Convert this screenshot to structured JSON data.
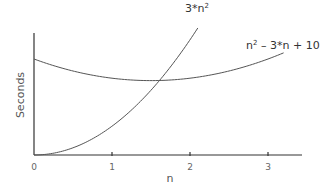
{
  "chart_data": {
    "type": "line",
    "title": "",
    "xlabel": "n",
    "ylabel": "Seconds",
    "xlim": [
      0,
      3.45
    ],
    "ylim": [
      0,
      15
    ],
    "x_ticks": [
      0,
      1,
      2,
      3
    ],
    "x_tick_labels": [
      "0",
      "1",
      "2",
      "3"
    ],
    "y_ticks": [],
    "grid": false,
    "legend": "inline labels at curve ends",
    "series": [
      {
        "name": "3*n²",
        "label_main": "3*n",
        "label_sup": "2",
        "formula": "3*n^2",
        "x": [
          0,
          0.25,
          0.5,
          0.75,
          1.0,
          1.25,
          1.5,
          1.75,
          2.0,
          2.1
        ],
        "values": [
          0,
          0.19,
          0.75,
          1.69,
          3.0,
          4.69,
          6.75,
          9.19,
          12.0,
          13.23
        ]
      },
      {
        "name": "n² – 3*n + 10",
        "label_main": "n",
        "label_sup": "2",
        "label_rest": " – 3*n + 10",
        "formula": "n^2 - 3*n + 10",
        "x": [
          0,
          0.5,
          1.0,
          1.5,
          2.0,
          2.5,
          3.0,
          3.2
        ],
        "values": [
          10,
          8.75,
          8.0,
          7.75,
          8.0,
          8.75,
          10.0,
          10.64
        ]
      }
    ],
    "annotations": [
      "Curves intersect near n ≈ 1.6"
    ]
  },
  "layout": {
    "origin_px": [
      34,
      155
    ],
    "x_scale_px_per_unit": 78,
    "y_scale_px_per_unit": 9.6,
    "x_axis_end_px": 302,
    "y_axis_top_px": 33,
    "line_color": "#555555",
    "axis_color": "#333333"
  }
}
